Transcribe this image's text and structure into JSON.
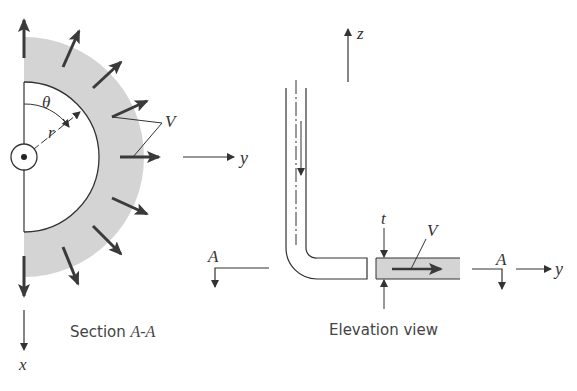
{
  "figure": {
    "section_view": {
      "caption_prefix": "Section ",
      "caption_italic": "A-A",
      "labels": {
        "theta": "θ",
        "r": "r",
        "V": "V",
        "y": "y",
        "x": "x"
      }
    },
    "elevation_view": {
      "caption": "Elevation view",
      "labels": {
        "z": "z",
        "t": "t",
        "V": "V",
        "A_left": "A",
        "A_right": "A",
        "y": "y"
      }
    },
    "colors": {
      "fluid_fill": "#d4d4d4",
      "line": "#333333",
      "arrow": "#3a3a3a"
    }
  }
}
